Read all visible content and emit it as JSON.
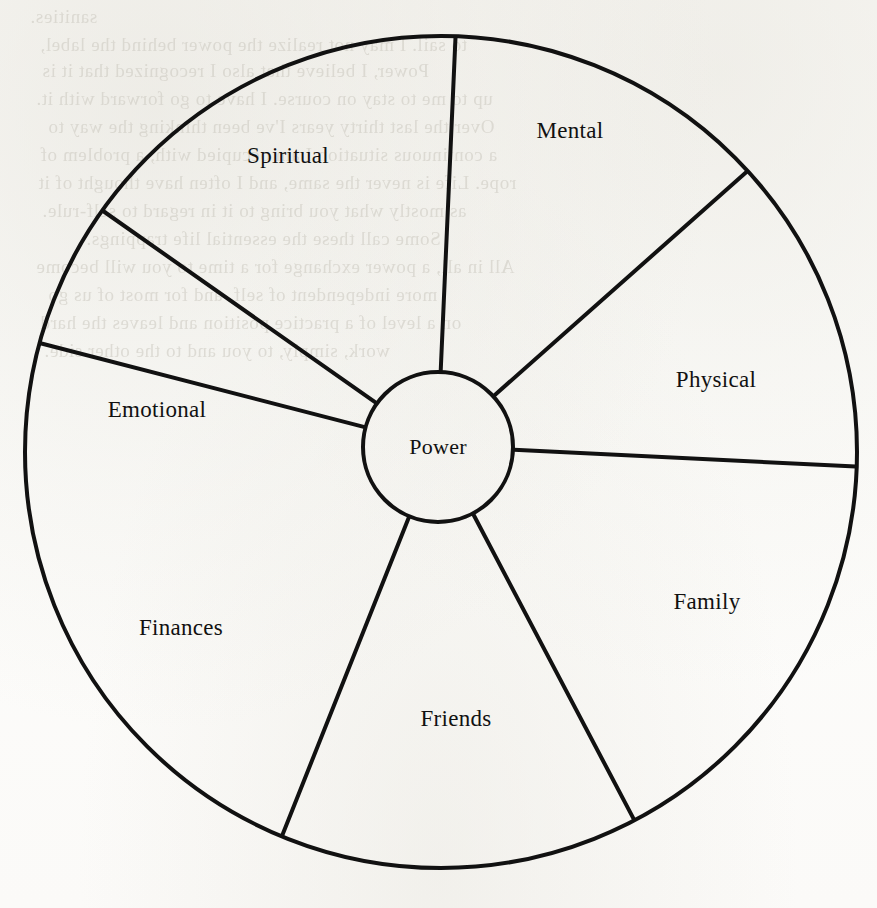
{
  "page": {
    "background_color": "#fdfdfb",
    "ink_color": "#111111",
    "width": 877,
    "height": 908
  },
  "diagram": {
    "type": "wheel-of-life",
    "title_visible": false,
    "hub": {
      "label": "Power",
      "center_x": 438,
      "center_y": 447,
      "radius": 75
    },
    "rim": {
      "center_x": 441,
      "center_y": 452,
      "radius": 416,
      "stroke_width": 4
    },
    "spoke_stroke_width": 4,
    "spokes_deg": [
      88,
      42.5,
      -2,
      -62.3,
      -112.5,
      164.8,
      144.5
    ],
    "sectors": [
      {
        "id": "mental",
        "label": "Mental",
        "label_x": 570,
        "label_y": 131,
        "start_deg": 42.5,
        "end_deg": 88
      },
      {
        "id": "physical",
        "label": "Physical",
        "label_x": 716,
        "label_y": 380,
        "start_deg": -2,
        "end_deg": 42.5
      },
      {
        "id": "family",
        "label": "Family",
        "label_x": 707,
        "label_y": 602,
        "start_deg": -62.3,
        "end_deg": -2
      },
      {
        "id": "friends",
        "label": "Friends",
        "label_x": 456,
        "label_y": 719,
        "start_deg": -112.5,
        "end_deg": -62.3
      },
      {
        "id": "finances",
        "label": "Finances",
        "label_x": 181,
        "label_y": 628,
        "start_deg": -164.8,
        "end_deg": -112.5
      },
      {
        "id": "emotional",
        "label": "Emotional",
        "label_x": 157,
        "label_y": 410,
        "start_deg": 144.5,
        "end_deg": 195.2
      },
      {
        "id": "spiritual",
        "label": "Spiritual",
        "label_x": 288,
        "label_y": 156,
        "start_deg": 88,
        "end_deg": 144.5
      }
    ]
  },
  "bleed_through": [
    {
      "text": "sanities.",
      "x": 30,
      "y": 6
    },
    {
      "text": "to sail. I may not realize the power behind the label,",
      "x": 40,
      "y": 34
    },
    {
      "text": "Power, I believe that also I recognized that it is",
      "x": 42,
      "y": 60
    },
    {
      "text": "up to me to stay on course. I have to go forward with it.",
      "x": 36,
      "y": 88
    },
    {
      "text": "Over the last thirty years I've been thinking the way to",
      "x": 48,
      "y": 116
    },
    {
      "text": "a continuous situation I am occupied with, a problem of",
      "x": 40,
      "y": 144
    },
    {
      "text": "rope. Life is never the same, and I often have thought of it",
      "x": 38,
      "y": 172
    },
    {
      "text": "as mostly what you bring to it in regard to self-rule.",
      "x": 42,
      "y": 200
    },
    {
      "text": "Some call these the essential life trappings.",
      "x": 86,
      "y": 228
    },
    {
      "text": "All in all, a power exchange for a time to you will become",
      "x": 36,
      "y": 256
    },
    {
      "text": "more independent of self, and for most of us go",
      "x": 48,
      "y": 284
    },
    {
      "text": "on a level of a practice position and leaves the hard",
      "x": 40,
      "y": 312
    },
    {
      "text": "work, simply, to you and to the other side.",
      "x": 44,
      "y": 340
    }
  ]
}
